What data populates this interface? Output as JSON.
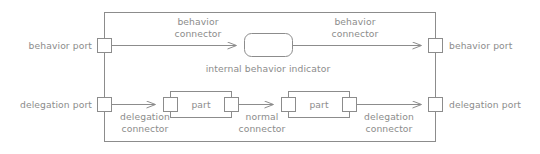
{
  "diagram": {
    "type": "composite-structure-diagram",
    "notation": "SysML internal block diagram legend",
    "colors": {
      "stroke": "#8c8c8c",
      "text": "#8c8c8c",
      "fill": "#ffffff",
      "background": "#ffffff"
    },
    "frame": {
      "name": "enclosing-block-frame",
      "x": 104,
      "y": 12,
      "width": 332,
      "height": 130
    },
    "labels": {
      "behavior_port_left": "behavior port",
      "behavior_port_right": "behavior port",
      "delegation_port_left": "delegation port",
      "delegation_port_right": "delegation port",
      "behavior_connector_left_line1": "behavior",
      "behavior_connector_left_line2": "connector",
      "behavior_connector_right_line1": "behavior",
      "behavior_connector_right_line2": "connector",
      "internal_behavior_indicator": "internal behavior indicator",
      "delegation_connector_left_line1": "delegation",
      "delegation_connector_left_line2": "connector",
      "delegation_connector_right_line1": "delegation",
      "delegation_connector_right_line2": "connector",
      "normal_connector_line1": "normal",
      "normal_connector_line2": "connector",
      "part_left": "part",
      "part_right": "part"
    },
    "nodes": [
      {
        "name": "behavior-port-left",
        "kind": "port",
        "x": 97,
        "y": 38,
        "w": 15,
        "h": 15
      },
      {
        "name": "behavior-port-right",
        "kind": "port",
        "x": 429,
        "y": 38,
        "w": 15,
        "h": 15
      },
      {
        "name": "delegation-port-left",
        "kind": "port",
        "x": 97,
        "y": 97,
        "w": 15,
        "h": 15
      },
      {
        "name": "delegation-port-right",
        "kind": "port",
        "x": 429,
        "y": 97,
        "w": 15,
        "h": 15
      },
      {
        "name": "internal-behavior-indicator",
        "kind": "rounded-rect",
        "x": 244,
        "y": 33,
        "w": 49,
        "h": 24
      },
      {
        "name": "part-left",
        "kind": "part-box",
        "x": 170,
        "y": 91,
        "w": 62,
        "h": 27
      },
      {
        "name": "part-right",
        "kind": "part-box",
        "x": 288,
        "y": 91,
        "w": 62,
        "h": 27
      },
      {
        "name": "part-left-port-in",
        "kind": "port",
        "x": 163,
        "y": 97,
        "w": 15,
        "h": 15
      },
      {
        "name": "part-left-port-out",
        "kind": "port",
        "x": 224,
        "y": 97,
        "w": 15,
        "h": 15
      },
      {
        "name": "part-right-port-in",
        "kind": "port",
        "x": 281,
        "y": 97,
        "w": 15,
        "h": 15
      },
      {
        "name": "part-right-port-out",
        "kind": "port",
        "x": 342,
        "y": 97,
        "w": 15,
        "h": 15
      }
    ],
    "connectors": [
      {
        "name": "behavior-connector-left",
        "from": "behavior-port-left",
        "to": "internal-behavior-indicator",
        "arrow": "open"
      },
      {
        "name": "behavior-connector-right",
        "from": "internal-behavior-indicator",
        "to": "behavior-port-right",
        "arrow": "open"
      },
      {
        "name": "delegation-connector-left",
        "from": "delegation-port-left",
        "to": "part-left-port-in",
        "arrow": "open"
      },
      {
        "name": "normal-connector",
        "from": "part-left-port-out",
        "to": "part-right-port-in",
        "arrow": "open"
      },
      {
        "name": "delegation-connector-right",
        "from": "part-right-port-out",
        "to": "delegation-port-right",
        "arrow": "open"
      }
    ]
  }
}
